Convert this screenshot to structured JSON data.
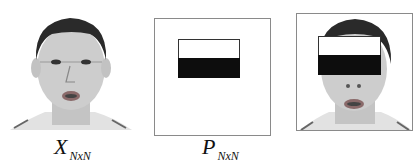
{
  "figure": {
    "panels": [
      {
        "id": "input-face",
        "description": "Original face image",
        "label_main": "X",
        "label_sub": "NxN"
      },
      {
        "id": "mask-pattern",
        "description": "Occlusion mask pattern",
        "label_main": "P",
        "label_sub": "NxN"
      },
      {
        "id": "occluded-face",
        "description": "Face with eye-region occluded by mask",
        "label_main": "",
        "label_sub": ""
      }
    ],
    "colors": {
      "frame": "#8a8a8a",
      "mask_black": "#0d0d0d",
      "mask_white": "#ffffff",
      "skin": "#cfcfcf",
      "hair": "#2a2a2a"
    }
  }
}
